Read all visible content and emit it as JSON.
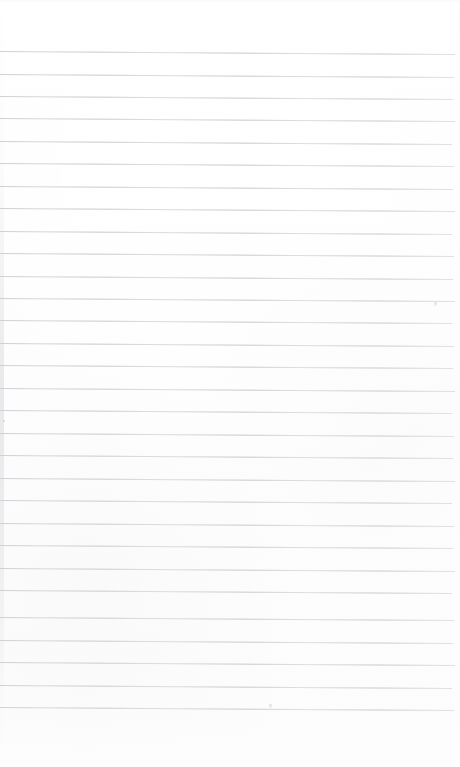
{
  "document": {
    "kind": "scanned-lined-notebook-page",
    "title": "Blank ruled notebook page",
    "page_width": 460,
    "page_height": 767,
    "background_color": "#fdfdfd",
    "rule_color": "#dedee1",
    "rule_thickness_px": 1,
    "written_content": "",
    "visible_text": ""
  },
  "layout": {
    "top_margin_px": 51,
    "bottom_margin_px": 60,
    "left_margin_px": 0,
    "right_margin_px": 8,
    "line_spacing_px": 22.6,
    "line_count": 30,
    "skew_degrees": 0.38,
    "has_vertical_margin_rule": false,
    "has_header": false,
    "has_page_number": false
  },
  "rules": [
    {
      "index": 1,
      "y": 51,
      "width": 455
    },
    {
      "index": 2,
      "y": 74,
      "width": 454
    },
    {
      "index": 3,
      "y": 96,
      "width": 453
    },
    {
      "index": 4,
      "y": 118,
      "width": 455
    },
    {
      "index": 5,
      "y": 141,
      "width": 452
    },
    {
      "index": 6,
      "y": 163,
      "width": 454
    },
    {
      "index": 7,
      "y": 186,
      "width": 453
    },
    {
      "index": 8,
      "y": 208,
      "width": 455
    },
    {
      "index": 9,
      "y": 231,
      "width": 452
    },
    {
      "index": 10,
      "y": 253,
      "width": 454
    },
    {
      "index": 11,
      "y": 276,
      "width": 453
    },
    {
      "index": 12,
      "y": 298,
      "width": 455
    },
    {
      "index": 13,
      "y": 320,
      "width": 452
    },
    {
      "index": 14,
      "y": 343,
      "width": 454
    },
    {
      "index": 15,
      "y": 365,
      "width": 453
    },
    {
      "index": 16,
      "y": 388,
      "width": 455
    },
    {
      "index": 17,
      "y": 410,
      "width": 452
    },
    {
      "index": 18,
      "y": 433,
      "width": 454
    },
    {
      "index": 19,
      "y": 455,
      "width": 453
    },
    {
      "index": 20,
      "y": 478,
      "width": 455
    },
    {
      "index": 21,
      "y": 500,
      "width": 452
    },
    {
      "index": 22,
      "y": 523,
      "width": 454
    },
    {
      "index": 23,
      "y": 545,
      "width": 453
    },
    {
      "index": 24,
      "y": 568,
      "width": 455
    },
    {
      "index": 25,
      "y": 590,
      "width": 452
    },
    {
      "index": 26,
      "y": 617,
      "width": 454
    },
    {
      "index": 27,
      "y": 640,
      "width": 453
    },
    {
      "index": 28,
      "y": 662,
      "width": 455
    },
    {
      "index": 29,
      "y": 685,
      "width": 452
    },
    {
      "index": 30,
      "y": 707,
      "width": 454
    }
  ],
  "artifacts": [
    {
      "name": "speck-right-upper",
      "x": 434,
      "y": 302,
      "type": "mark"
    },
    {
      "name": "speck-bottom-center",
      "x": 269,
      "y": 704,
      "type": "mark"
    },
    {
      "name": "speck-left-mid",
      "x": 3,
      "y": 420,
      "type": "dot"
    }
  ]
}
